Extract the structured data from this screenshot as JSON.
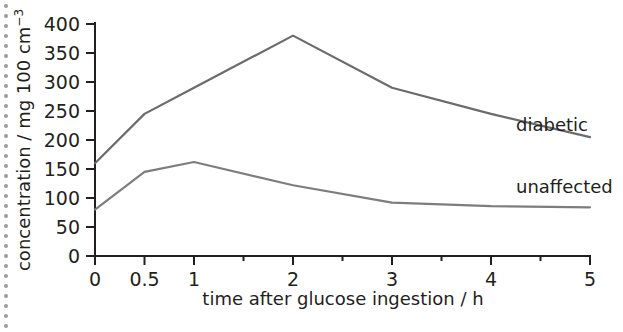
{
  "chart_data": {
    "type": "line",
    "title": "",
    "xlabel": "time after glucose ingestion / h",
    "ylabel_main": "concentration / mg 100 cm",
    "ylabel_exponent": "−3",
    "ylabel_full": "concentration / mg 100 cm⁻³",
    "xlim": [
      0,
      5
    ],
    "ylim": [
      0,
      400
    ],
    "grid": false,
    "legend": "inline-right-of-curves",
    "x_tick_labels": [
      "0",
      "0.5",
      "1",
      "2",
      "3",
      "4",
      "5"
    ],
    "x_tick_values": [
      0,
      0.5,
      1,
      2,
      3,
      4,
      5
    ],
    "x_minor_tick_values": [
      1.5,
      2.5,
      3.5,
      4.5
    ],
    "y_tick_labels": [
      "0",
      "50",
      "100",
      "150",
      "200",
      "250",
      "300",
      "350",
      "400"
    ],
    "y_tick_values": [
      0,
      50,
      100,
      150,
      200,
      250,
      300,
      350,
      400
    ],
    "x": [
      0,
      0.5,
      1,
      2,
      3,
      4,
      5
    ],
    "series": [
      {
        "name": "diabetic",
        "color": "#6b6b6b",
        "values": [
          160,
          245,
          290,
          380,
          290,
          245,
          205
        ]
      },
      {
        "name": "unaffected",
        "color": "#7d7d7d",
        "values": [
          80,
          145,
          162,
          122,
          92,
          86,
          84
        ]
      }
    ]
  },
  "decoration": {
    "dot_rail_name": "dotted-rail",
    "dot_color": "#9b9b9b",
    "dot_count": 33
  },
  "axis": {
    "line_color": "#231f20"
  }
}
